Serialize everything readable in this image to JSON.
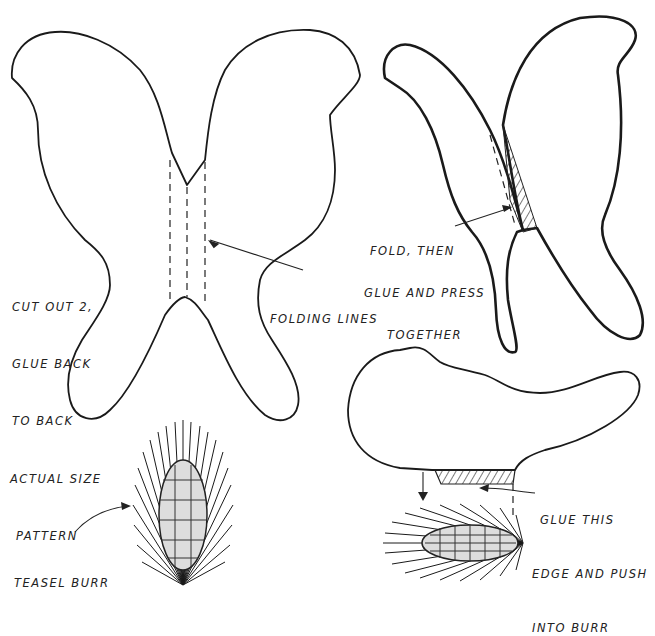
{
  "diagram": {
    "type": "craft-pattern-instructions",
    "labels": {
      "cut_out": [
        "CUT OUT 2,",
        "GLUE BACK",
        "TO BACK"
      ],
      "folding_lines": "FOLDING LINES",
      "fold_then": [
        "FOLD, THEN",
        "GLUE AND PRESS",
        "TOGETHER"
      ],
      "actual_size": [
        "ACTUAL SIZE",
        "PATTERN"
      ],
      "teasel_burr": "TEASEL BURR",
      "glue_this": [
        "GLUE THIS",
        "EDGE AND PUSH",
        "INTO BURR"
      ]
    },
    "figures": [
      {
        "name": "wing-pattern",
        "description": "Butterfly-shaped wing cut-out with three dashed folding lines in the center"
      },
      {
        "name": "folded-wings",
        "description": "Pattern folded with hatched glued area"
      },
      {
        "name": "teasel-burr-upright",
        "description": "Upright spiky teasel burr"
      },
      {
        "name": "wing-on-burr",
        "description": "Folded wing with hatched glue edge pushed into horizontal teasel burr"
      }
    ],
    "colors": {
      "ink": "#1a1a1a",
      "paper": "#ffffff"
    }
  }
}
